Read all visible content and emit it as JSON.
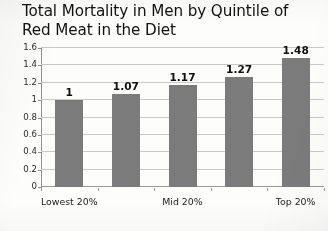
{
  "chart_data": {
    "type": "bar",
    "title": "Total Mortality in Men by Quintile of\nRed Meat in the Diet",
    "title_line1": "Total Mortality in Men by Quintile of",
    "title_line2": "Red Meat in the Diet",
    "xlabel": "",
    "ylabel": "",
    "categories": [
      "Lowest 20%",
      "",
      "Mid 20%",
      "",
      "Top 20%"
    ],
    "values": [
      1,
      1.07,
      1.17,
      1.27,
      1.48
    ],
    "value_labels": [
      "1",
      "1.07",
      "1.17",
      "1.27",
      "1.48"
    ],
    "ylim": [
      0,
      1.6
    ],
    "y_ticks": [
      0,
      0.2,
      0.4,
      0.6,
      0.8,
      1,
      1.2,
      1.4,
      1.6
    ],
    "y_tick_labels": [
      "0",
      "0.2",
      "0.4",
      "0.6",
      "0.8",
      "1",
      "1.2",
      "1.4",
      "1.6"
    ],
    "x_tick_labels": [
      "Lowest 20%",
      "Mid 20%",
      "Top 20%"
    ],
    "x_tick_label_positions": [
      0,
      2,
      4
    ],
    "grid": true,
    "grid_axis": "y",
    "legend": false,
    "legend_position": "none",
    "series": [
      {
        "name": "Total Mortality",
        "values": [
          1,
          1.07,
          1.17,
          1.27,
          1.48
        ]
      }
    ],
    "colors": {
      "bar": "#7b7b7b",
      "gridline": "#c9c9c9",
      "axis": "#8f8f8f",
      "text": "#1d1d1d",
      "background": "#fdfdfb"
    }
  }
}
